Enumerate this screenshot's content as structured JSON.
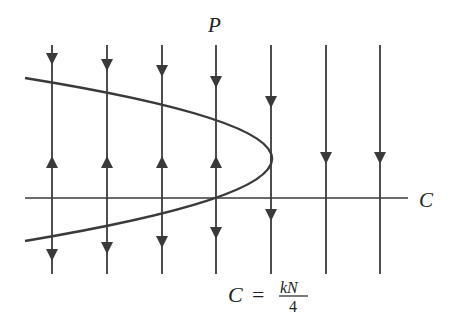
{
  "diagram": {
    "type": "phase-line diagram",
    "colors": {
      "stroke": "#3a3a3a",
      "text": "#222222",
      "background": "#ffffff"
    },
    "labels": {
      "vertical_axis": "P",
      "horizontal_axis": "C",
      "formula_lhs": "C",
      "formula_eq": "=",
      "formula_num": "kN",
      "formula_den": "4"
    },
    "axis": {
      "y": 198,
      "x_start": 25,
      "x_end": 408
    },
    "curve": {
      "shape": "parabola opening left",
      "vertex": [
        272,
        158
      ],
      "upper_end": [
        25,
        78
      ],
      "lower_end": [
        25,
        241
      ]
    },
    "vertical_lines": [
      {
        "x": 52,
        "arrows": [
          {
            "y": 59,
            "dir": "down"
          },
          {
            "y": 162,
            "dir": "up"
          },
          {
            "y": 255,
            "dir": "down"
          }
        ]
      },
      {
        "x": 107,
        "arrows": [
          {
            "y": 65,
            "dir": "down"
          },
          {
            "y": 162,
            "dir": "up"
          },
          {
            "y": 248,
            "dir": "down"
          }
        ]
      },
      {
        "x": 162,
        "arrows": [
          {
            "y": 71,
            "dir": "down"
          },
          {
            "y": 162,
            "dir": "up"
          },
          {
            "y": 242,
            "dir": "down"
          }
        ]
      },
      {
        "x": 216,
        "arrows": [
          {
            "y": 82,
            "dir": "down"
          },
          {
            "y": 162,
            "dir": "up"
          },
          {
            "y": 233,
            "dir": "down"
          }
        ]
      },
      {
        "x": 271,
        "arrows": [
          {
            "y": 102,
            "dir": "down"
          },
          {
            "y": 215,
            "dir": "down"
          }
        ]
      },
      {
        "x": 326,
        "arrows": [
          {
            "y": 158,
            "dir": "down"
          }
        ]
      },
      {
        "x": 380,
        "arrows": [
          {
            "y": 158,
            "dir": "down"
          }
        ]
      }
    ],
    "line_top": 45,
    "line_bottom": 274
  }
}
